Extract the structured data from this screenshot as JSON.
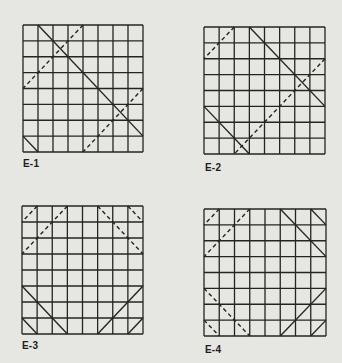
{
  "figure": {
    "grid_size": 8,
    "line_color": "#242424",
    "background": "#e6e6e3",
    "panels": [
      {
        "label": "E-1",
        "box": {
          "x": 23,
          "y": 25,
          "w": 120,
          "h": 127
        },
        "label_pos": {
          "x": 23,
          "y": 158
        },
        "solid": [
          [
            1,
            0,
            8,
            7
          ],
          [
            0,
            7,
            1,
            8
          ]
        ],
        "dashed": [
          [
            4,
            0,
            0,
            4
          ],
          [
            8,
            4,
            4,
            8
          ]
        ]
      },
      {
        "label": "E-2",
        "box": {
          "x": 204,
          "y": 27,
          "w": 121,
          "h": 127
        },
        "label_pos": {
          "x": 205,
          "y": 162
        },
        "solid": [
          [
            3,
            0,
            8,
            5
          ],
          [
            0,
            5,
            3,
            8
          ]
        ],
        "dashed": [
          [
            2,
            0,
            0,
            2
          ],
          [
            8,
            2,
            2,
            8
          ]
        ]
      },
      {
        "label": "E-3",
        "box": {
          "x": 22,
          "y": 206,
          "w": 121,
          "h": 128
        },
        "label_pos": {
          "x": 22,
          "y": 340
        },
        "solid": [
          [
            0,
            5,
            3,
            8
          ],
          [
            0,
            7,
            1,
            8
          ],
          [
            8,
            5,
            5,
            8
          ],
          [
            8,
            7,
            7,
            8
          ]
        ],
        "dashed": [
          [
            1,
            0,
            0,
            1
          ],
          [
            3,
            0,
            0,
            3
          ],
          [
            5,
            0,
            8,
            3
          ],
          [
            7,
            0,
            8,
            1
          ]
        ]
      },
      {
        "label": "E-4",
        "box": {
          "x": 204,
          "y": 209,
          "w": 122,
          "h": 127
        },
        "label_pos": {
          "x": 205,
          "y": 344
        },
        "solid": [
          [
            5,
            0,
            8,
            3
          ],
          [
            7,
            0,
            8,
            1
          ],
          [
            8,
            5,
            5,
            8
          ],
          [
            8,
            7,
            7,
            8
          ]
        ],
        "dashed": [
          [
            1,
            0,
            0,
            1
          ],
          [
            3,
            0,
            0,
            3
          ],
          [
            0,
            5,
            3,
            8
          ],
          [
            0,
            7,
            1,
            8
          ]
        ]
      }
    ]
  }
}
